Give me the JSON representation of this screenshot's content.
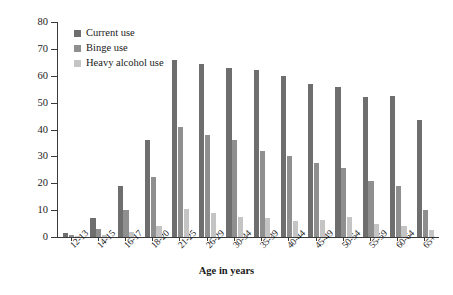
{
  "chart_data": {
    "type": "bar",
    "title": "",
    "xlabel": "Age in years",
    "ylabel": "Percentage",
    "ylim": [
      0,
      80
    ],
    "yticks": [
      0,
      10,
      20,
      30,
      40,
      50,
      60,
      70,
      80
    ],
    "grid": false,
    "legend_position": "top-left",
    "categories": [
      "12-13",
      "14-15",
      "16-17",
      "18-20",
      "21-25",
      "26-29",
      "30-34",
      "35-39",
      "40-44",
      "45-49",
      "50-54",
      "55-59",
      "60-64",
      "65+"
    ],
    "series": [
      {
        "name": "Current use",
        "color": "#6e6e6e",
        "values": [
          1.5,
          7,
          19,
          36,
          66,
          64.5,
          63,
          62,
          60,
          57,
          56,
          52,
          52.5,
          43.5
        ]
      },
      {
        "name": "Binge use",
        "color": "#8f8f8f",
        "values": [
          0.6,
          3,
          10,
          22.5,
          41,
          38,
          36,
          32,
          30,
          27.5,
          25.5,
          21,
          19,
          10
        ]
      },
      {
        "name": "Heavy alcohol use",
        "color": "#c4c4c4",
        "values": [
          0.2,
          0.6,
          2,
          4,
          10.5,
          9,
          7.5,
          7,
          6,
          6.5,
          7.5,
          5,
          4,
          2.5
        ]
      }
    ]
  }
}
